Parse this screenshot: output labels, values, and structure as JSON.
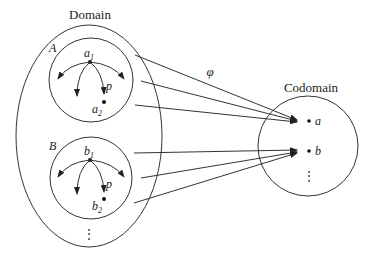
{
  "diagram": {
    "domain_label": "Domain",
    "codomain_label": "Codomain",
    "map_label": "φ",
    "subsets": [
      {
        "name": "A",
        "top": "a",
        "top_sub": "1",
        "bottom": "a",
        "bottom_sub": "2",
        "edge_label": "p"
      },
      {
        "name": "B",
        "top": "b",
        "top_sub": "1",
        "bottom": "b",
        "bottom_sub": "2",
        "edge_label": "p"
      }
    ],
    "domain_ellipsis": "⋮",
    "codomain_points": [
      "a",
      "b"
    ],
    "codomain_ellipsis": "⋮",
    "stroke_color": "#333333"
  }
}
